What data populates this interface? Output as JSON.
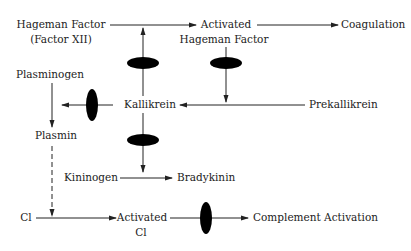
{
  "diagram": {
    "nodes": {
      "hageman_factor": {
        "line1": "Hageman Factor",
        "line2": "(Factor XII)"
      },
      "activated_hageman": {
        "line1": "Activated",
        "line2": "Hageman Factor"
      },
      "coagulation": {
        "label": "Coagulation"
      },
      "plasminogen": {
        "label": "Plasminogen"
      },
      "kallikrein": {
        "label": "Kallikrein"
      },
      "prekallikrein": {
        "label": "Prekallikrein"
      },
      "plasmin": {
        "label": "Plasmin"
      },
      "kininogen": {
        "label": "Kininogen"
      },
      "bradykinin": {
        "label": "Bradykinin"
      },
      "c1": {
        "label": "Cl"
      },
      "activated_c1": {
        "line1": "Activated",
        "line2": "Cl"
      },
      "complement_activation": {
        "label": "Complement Activation"
      }
    },
    "edges": [
      {
        "from": "hageman_factor",
        "to": "activated_hageman",
        "style": "solid"
      },
      {
        "from": "activated_hageman",
        "to": "coagulation",
        "style": "solid"
      },
      {
        "from": "kallikrein",
        "to": "hageman_factor-arrow",
        "style": "solid",
        "inhibitor_marker": true
      },
      {
        "from": "activated_hageman",
        "to": "prekallikrein-arrow",
        "style": "solid",
        "inhibitor_marker": true
      },
      {
        "from": "prekallikrein",
        "to": "kallikrein",
        "style": "solid"
      },
      {
        "from": "kallikrein",
        "to": "plasminogen-arrow",
        "style": "solid",
        "inhibitor_marker": true
      },
      {
        "from": "plasminogen",
        "to": "plasmin",
        "style": "solid"
      },
      {
        "from": "kallikrein",
        "to": "kininogen-arrow",
        "style": "solid",
        "inhibitor_marker": true
      },
      {
        "from": "kininogen",
        "to": "bradykinin",
        "style": "solid"
      },
      {
        "from": "plasmin",
        "to": "c1-arrow",
        "style": "dashed"
      },
      {
        "from": "c1",
        "to": "activated_c1",
        "style": "solid"
      },
      {
        "from": "activated_c1",
        "to": "complement_activation",
        "style": "solid",
        "inhibitor_marker": true
      }
    ]
  }
}
